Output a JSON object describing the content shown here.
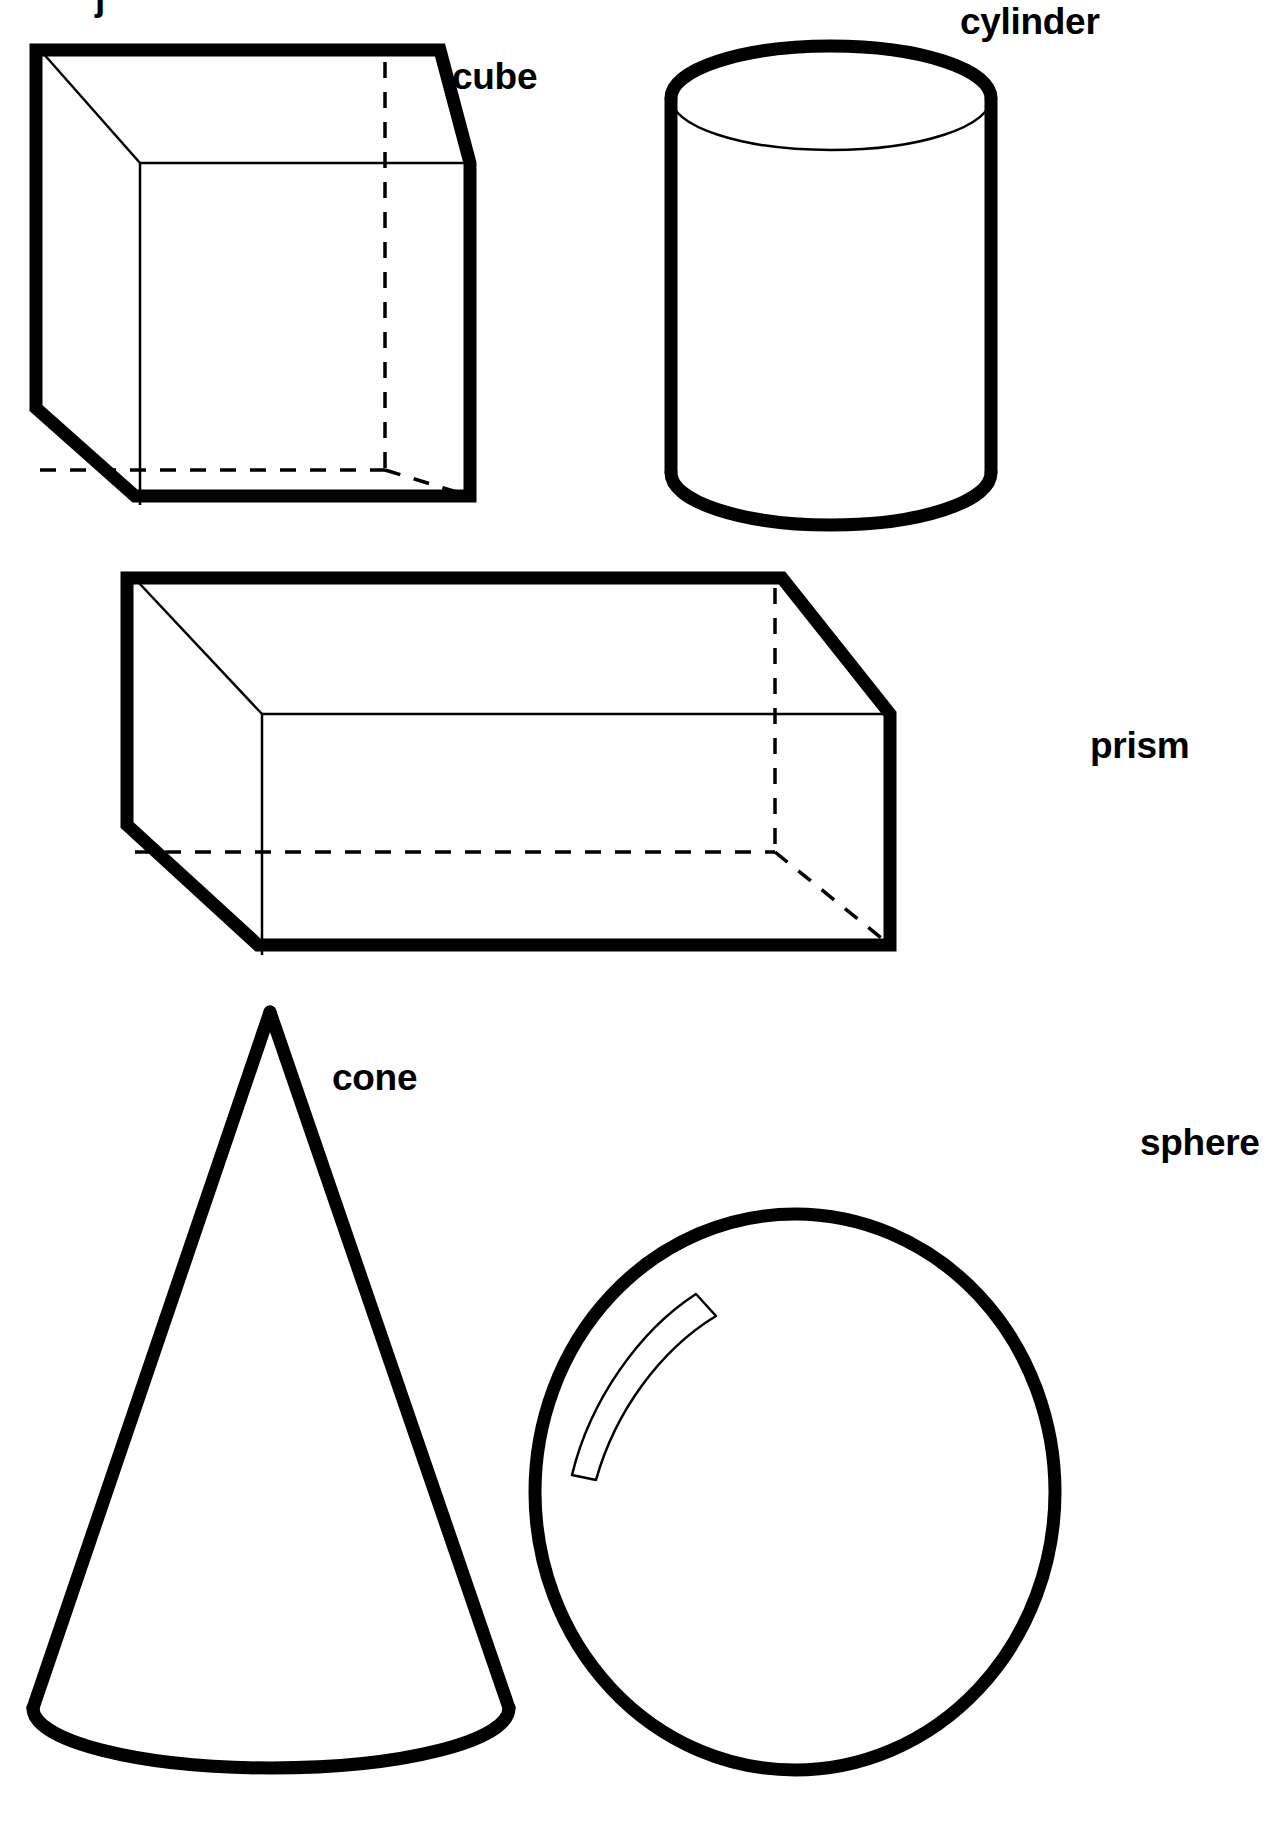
{
  "page": {
    "background_color": "#ffffff",
    "ink_color": "#000000",
    "width": 1283,
    "height": 1829,
    "clipped_header_fragment": "j"
  },
  "figure": {
    "style": {
      "outline_color": "#000000",
      "bold_stroke_width": 13,
      "thin_stroke_width": 2.5,
      "hidden_stroke_width": 3.5,
      "hidden_dash_pattern": "16 14"
    },
    "solids": [
      {
        "id": "cube",
        "label": "cube",
        "label_x": 452,
        "label_y": 89,
        "description": "cube drawn in oblique projection with hidden back edges dashed"
      },
      {
        "id": "cylinder",
        "label": "cylinder",
        "label_x": 960,
        "label_y": 34,
        "description": "upright cylinder with visible top ellipse and dashed hidden base arc"
      },
      {
        "id": "prism",
        "label": "prism",
        "label_x": 1090,
        "label_y": 758,
        "description": "rectangular prism lying horizontally with hidden back edges dashed"
      },
      {
        "id": "cone",
        "label": "cone",
        "label_x": 332,
        "label_y": 1090,
        "description": "cone with apex on top and dashed hidden base arc"
      },
      {
        "id": "sphere",
        "label": "sphere",
        "label_x": 1140,
        "label_y": 1155,
        "description": "sphere with a crescent shaped highlight in the upper left"
      }
    ]
  }
}
